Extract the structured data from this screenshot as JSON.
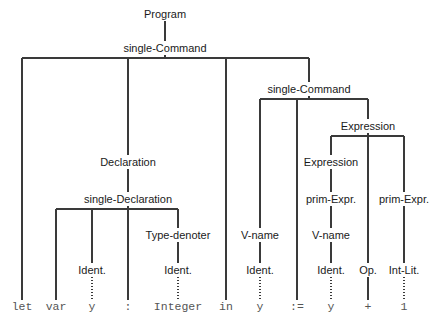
{
  "diagram": {
    "type": "syntax-tree",
    "line_color": "#3a3a3a",
    "node_text_color": "#1a1a1a",
    "terminal_text_color": "#555555",
    "background": "#ffffff",
    "nodes": [
      {
        "id": "program",
        "label": "Program",
        "x": 165,
        "y": 14,
        "kind": "nonterminal"
      },
      {
        "id": "sc-root",
        "label": "single-Command",
        "x": 165,
        "y": 48,
        "kind": "nonterminal"
      },
      {
        "id": "sc-right",
        "label": "single-Command",
        "x": 309,
        "y": 89,
        "kind": "nonterminal"
      },
      {
        "id": "expr-outer",
        "label": "Expression",
        "x": 368,
        "y": 126,
        "kind": "nonterminal"
      },
      {
        "id": "declaration",
        "label": "Declaration",
        "x": 128,
        "y": 162,
        "kind": "nonterminal"
      },
      {
        "id": "expr-inner",
        "label": "Expression",
        "x": 331,
        "y": 162,
        "kind": "nonterminal"
      },
      {
        "id": "single-decl",
        "label": "single-Declaration",
        "x": 128,
        "y": 199,
        "kind": "nonterminal"
      },
      {
        "id": "prim-expr-l",
        "label": "prim-Expr.",
        "x": 331,
        "y": 199,
        "kind": "nonterminal"
      },
      {
        "id": "prim-expr-r",
        "label": "prim-Expr.",
        "x": 404,
        "y": 199,
        "kind": "nonterminal"
      },
      {
        "id": "type-denoter",
        "label": "Type-denoter",
        "x": 178,
        "y": 235,
        "kind": "nonterminal"
      },
      {
        "id": "vname-1",
        "label": "V-name",
        "x": 260,
        "y": 235,
        "kind": "nonterminal"
      },
      {
        "id": "vname-2",
        "label": "V-name",
        "x": 331,
        "y": 235,
        "kind": "nonterminal"
      },
      {
        "id": "ident-var",
        "label": "Ident.",
        "x": 92,
        "y": 270,
        "kind": "nonterminal"
      },
      {
        "id": "ident-type",
        "label": "Ident.",
        "x": 178,
        "y": 270,
        "kind": "nonterminal"
      },
      {
        "id": "ident-lhs",
        "label": "Ident.",
        "x": 260,
        "y": 270,
        "kind": "nonterminal"
      },
      {
        "id": "ident-rhs",
        "label": "Ident.",
        "x": 331,
        "y": 270,
        "kind": "nonterminal"
      },
      {
        "id": "op",
        "label": "Op.",
        "x": 368,
        "y": 270,
        "kind": "nonterminal"
      },
      {
        "id": "int-lit",
        "label": "Int-Lit.",
        "x": 404,
        "y": 270,
        "kind": "nonterminal"
      }
    ],
    "terminals": [
      {
        "id": "t-let",
        "label": "let",
        "x": 22,
        "y": 307
      },
      {
        "id": "t-var",
        "label": "var",
        "x": 56,
        "y": 307
      },
      {
        "id": "t-y1",
        "label": "y",
        "x": 92,
        "y": 307
      },
      {
        "id": "t-colon",
        "label": ":",
        "x": 128,
        "y": 307
      },
      {
        "id": "t-integer",
        "label": "Integer",
        "x": 178,
        "y": 307
      },
      {
        "id": "t-in",
        "label": "in",
        "x": 226,
        "y": 307
      },
      {
        "id": "t-y2",
        "label": "y",
        "x": 260,
        "y": 307
      },
      {
        "id": "t-assign",
        "label": ":=",
        "x": 297,
        "y": 307
      },
      {
        "id": "t-y3",
        "label": "y",
        "x": 331,
        "y": 307
      },
      {
        "id": "t-plus",
        "label": "+",
        "x": 368,
        "y": 307
      },
      {
        "id": "t-one",
        "label": "1",
        "x": 404,
        "y": 307
      }
    ],
    "edges": [
      {
        "id": "e-program-sc",
        "from": "program",
        "to": "sc-root",
        "style": "solid"
      },
      {
        "id": "e-sc-let",
        "from": "sc-root",
        "to": "t-let",
        "style": "solid"
      },
      {
        "id": "e-sc-declaration",
        "from": "sc-root",
        "to": "declaration",
        "style": "solid"
      },
      {
        "id": "e-sc-in",
        "from": "sc-root",
        "to": "t-in",
        "style": "solid"
      },
      {
        "id": "e-sc-scright",
        "from": "sc-root",
        "to": "sc-right",
        "style": "solid"
      },
      {
        "id": "e-decl-singledecl",
        "from": "declaration",
        "to": "single-decl",
        "style": "solid"
      },
      {
        "id": "e-sd-var",
        "from": "single-decl",
        "to": "t-var",
        "style": "solid"
      },
      {
        "id": "e-sd-identvar",
        "from": "single-decl",
        "to": "ident-var",
        "style": "solid"
      },
      {
        "id": "e-sd-colon",
        "from": "single-decl",
        "to": "t-colon",
        "style": "solid"
      },
      {
        "id": "e-sd-typedenoter",
        "from": "single-decl",
        "to": "type-denoter",
        "style": "solid"
      },
      {
        "id": "e-td-identtype",
        "from": "type-denoter",
        "to": "ident-type",
        "style": "solid"
      },
      {
        "id": "e-identvar-y",
        "from": "ident-var",
        "to": "t-y1",
        "style": "dotted"
      },
      {
        "id": "e-identtype-integer",
        "from": "ident-type",
        "to": "t-integer",
        "style": "dotted"
      },
      {
        "id": "e-scr-vname1",
        "from": "sc-right",
        "to": "vname-1",
        "style": "solid"
      },
      {
        "id": "e-scr-assign",
        "from": "sc-right",
        "to": "t-assign",
        "style": "solid"
      },
      {
        "id": "e-scr-exprouter",
        "from": "sc-right",
        "to": "expr-outer",
        "style": "solid"
      },
      {
        "id": "e-vname1-ident",
        "from": "vname-1",
        "to": "ident-lhs",
        "style": "solid"
      },
      {
        "id": "e-identlhs-y",
        "from": "ident-lhs",
        "to": "t-y2",
        "style": "dotted"
      },
      {
        "id": "e-eo-exprinner",
        "from": "expr-outer",
        "to": "expr-inner",
        "style": "solid"
      },
      {
        "id": "e-eo-op",
        "from": "expr-outer",
        "to": "op",
        "style": "solid"
      },
      {
        "id": "e-eo-primexprr",
        "from": "expr-outer",
        "to": "prim-expr-r",
        "style": "solid"
      },
      {
        "id": "e-ei-primexprl",
        "from": "expr-inner",
        "to": "prim-expr-l",
        "style": "solid"
      },
      {
        "id": "e-pel-vname2",
        "from": "prim-expr-l",
        "to": "vname-2",
        "style": "solid"
      },
      {
        "id": "e-vname2-ident",
        "from": "vname-2",
        "to": "ident-rhs",
        "style": "solid"
      },
      {
        "id": "e-identrhs-y",
        "from": "ident-rhs",
        "to": "t-y3",
        "style": "dotted"
      },
      {
        "id": "e-op-plus",
        "from": "op",
        "to": "t-plus",
        "style": "solid"
      },
      {
        "id": "e-per-intlit",
        "from": "prim-expr-r",
        "to": "int-lit",
        "style": "solid"
      },
      {
        "id": "e-intlit-one",
        "from": "int-lit",
        "to": "t-one",
        "style": "dotted"
      }
    ]
  }
}
